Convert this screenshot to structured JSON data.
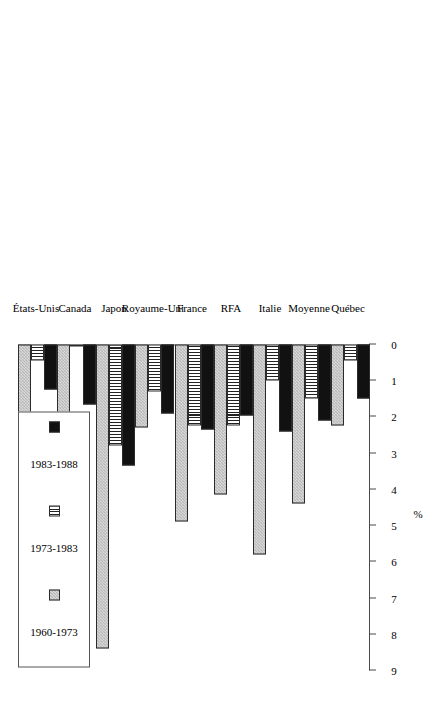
{
  "chart_data": {
    "type": "bar",
    "orientation": "horizontal",
    "title": "",
    "xlabel": "",
    "ylabel": "%",
    "axis_label": "%",
    "xlim": [
      0,
      9
    ],
    "tick_labels": [
      "0",
      "1",
      "2",
      "3",
      "4",
      "5",
      "6",
      "7",
      "8",
      "9"
    ],
    "tick_values": [
      0,
      1,
      2,
      3,
      4,
      5,
      6,
      7,
      8,
      9
    ],
    "axis_reversed": true,
    "grid": false,
    "legend_position": "top-left",
    "categories": [
      "États-Unis",
      "Canada",
      "Japon",
      "Royaume-Uni",
      "France",
      "RFA",
      "Italie",
      "Moyenne",
      "Québec"
    ],
    "series": [
      {
        "name": "1960-1973",
        "pattern": "checker-gray",
        "color": "#b9b9b9",
        "values": [
          2.2,
          2.75,
          8.4,
          2.3,
          4.9,
          4.15,
          5.8,
          4.4,
          2.25
        ]
      },
      {
        "name": "1973-1983",
        "pattern": "vertical-stripes",
        "color": "#ffffff",
        "values": [
          0.45,
          0.05,
          2.8,
          1.3,
          2.25,
          2.25,
          1.0,
          1.5,
          0.45
        ]
      },
      {
        "name": "1983-1988",
        "pattern": "solid-black",
        "color": "#111111",
        "values": [
          1.25,
          1.65,
          3.35,
          1.9,
          2.35,
          1.95,
          2.4,
          2.1,
          1.5
        ]
      }
    ]
  },
  "legend": {
    "items": [
      {
        "label": "1960-1973"
      },
      {
        "label": "1973-1983"
      },
      {
        "label": "1983-1988"
      }
    ]
  }
}
